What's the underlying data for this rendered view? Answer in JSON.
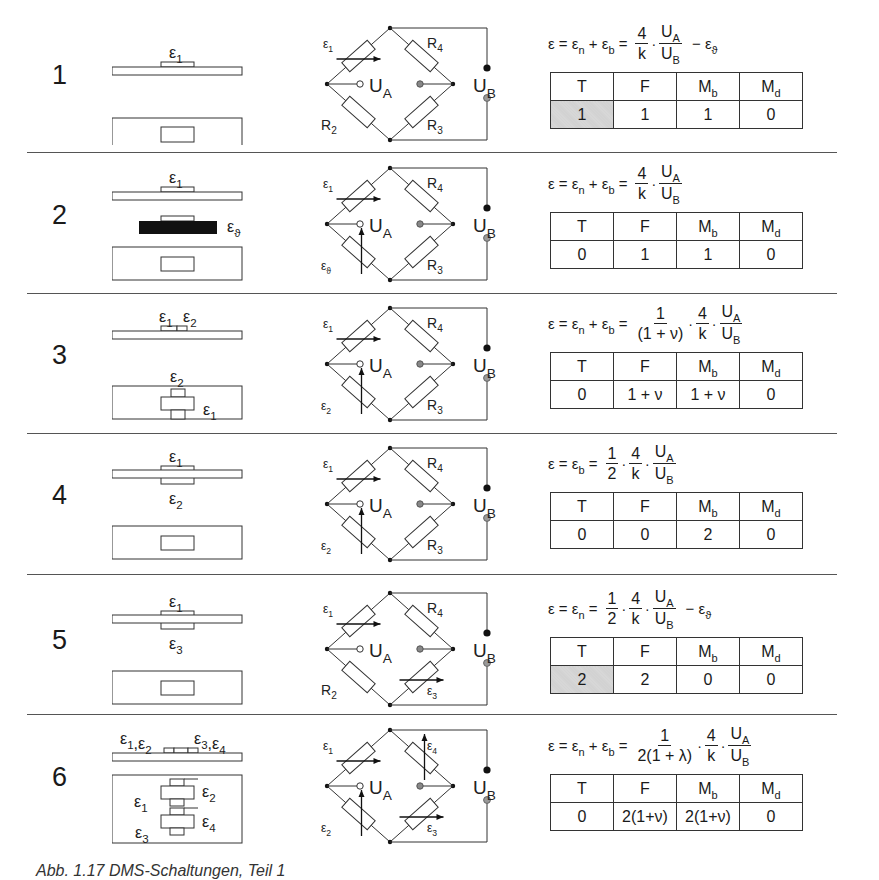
{
  "figure": {
    "caption": "Abb. 1.17 DMS-Schaltungen, Teil 1",
    "columns": [
      "T",
      "F",
      "M",
      "M"
    ],
    "column_subscripts": [
      "",
      "",
      "b",
      "d"
    ],
    "shade_color": "#d4d4d4"
  },
  "rows": [
    {
      "number": "1",
      "gauge_labels_side": [
        "ε1"
      ],
      "gauge_labels_top": [],
      "bridge": {
        "arm_tl": "ε1",
        "arm_tr": "R4",
        "arm_bl": "R2",
        "arm_br": "R3",
        "ua": "UA",
        "ub": "UB"
      },
      "equation": {
        "lhs": "ε = εn + εb =",
        "factors": [
          {
            "num": "4",
            "den": "k"
          },
          {
            "num": "UA",
            "den": "UB"
          }
        ],
        "suffix": "− εϑ"
      },
      "values": [
        "1",
        "1",
        "1",
        "0"
      ],
      "shaded_T": true
    },
    {
      "number": "2",
      "gauge_labels_side": [
        "ε1",
        "εϑ"
      ],
      "gauge_labels_top": [],
      "bridge": {
        "arm_tl": "ε1",
        "arm_tr": "R4",
        "arm_bl": "εϑ",
        "arm_br": "R3",
        "ua": "UA",
        "ub": "UB"
      },
      "equation": {
        "lhs": "ε = εn + εb =",
        "factors": [
          {
            "num": "4",
            "den": "k"
          },
          {
            "num": "UA",
            "den": "UB"
          }
        ],
        "suffix": ""
      },
      "values": [
        "0",
        "1",
        "1",
        "0"
      ],
      "shaded_T": false
    },
    {
      "number": "3",
      "gauge_labels_side": [
        "ε1 ε2"
      ],
      "gauge_labels_top": [
        "ε2",
        "ε1"
      ],
      "bridge": {
        "arm_tl": "ε1",
        "arm_tr": "R4",
        "arm_bl": "ε2",
        "arm_br": "R3",
        "ua": "UA",
        "ub": "UB"
      },
      "equation": {
        "lhs": "ε = εn + εb =",
        "factors": [
          {
            "num": "1",
            "den": "(1 + ν)"
          },
          {
            "num": "4",
            "den": "k"
          },
          {
            "num": "UA",
            "den": "UB"
          }
        ],
        "suffix": ""
      },
      "values": [
        "0",
        "1 + ν",
        "1 + ν",
        "0"
      ],
      "shaded_T": false
    },
    {
      "number": "4",
      "gauge_labels_side": [
        "ε1",
        "ε2"
      ],
      "gauge_labels_top": [],
      "bridge": {
        "arm_tl": "ε1",
        "arm_tr": "R4",
        "arm_bl": "ε2",
        "arm_br": "R3",
        "ua": "UA",
        "ub": "UB"
      },
      "equation": {
        "lhs": "ε = εb =",
        "factors": [
          {
            "num": "1",
            "den": "2"
          },
          {
            "num": "4",
            "den": "k"
          },
          {
            "num": "UA",
            "den": "UB"
          }
        ],
        "suffix": ""
      },
      "values": [
        "0",
        "0",
        "2",
        "0"
      ],
      "shaded_T": false
    },
    {
      "number": "5",
      "gauge_labels_side": [
        "ε1",
        "ε3"
      ],
      "gauge_labels_top": [],
      "bridge": {
        "arm_tl": "ε1",
        "arm_tr": "R4",
        "arm_bl": "R2",
        "arm_br": "ε3",
        "ua": "UA",
        "ub": "UB"
      },
      "equation": {
        "lhs": "ε = εn =",
        "factors": [
          {
            "num": "1",
            "den": "2"
          },
          {
            "num": "4",
            "den": "k"
          },
          {
            "num": "UA",
            "den": "UB"
          }
        ],
        "suffix": "− εϑ"
      },
      "values": [
        "2",
        "2",
        "0",
        "0"
      ],
      "shaded_T": true
    },
    {
      "number": "6",
      "gauge_labels_side": [
        "ε1,ε2",
        "ε3,ε4"
      ],
      "gauge_labels_top": [
        "ε1",
        "ε2",
        "ε3",
        "ε4"
      ],
      "bridge": {
        "arm_tl": "ε1",
        "arm_tr": "ε4",
        "arm_bl": "ε2",
        "arm_br": "ε3",
        "ua": "UA",
        "ub": "UB"
      },
      "equation": {
        "lhs": "ε = εn + εb =",
        "factors": [
          {
            "num": "1",
            "den": "2(1 + λ)"
          },
          {
            "num": "4",
            "den": "k"
          },
          {
            "num": "UA",
            "den": "UB"
          }
        ],
        "suffix": ""
      },
      "values": [
        "0",
        "2(1+ν)",
        "2(1+ν)",
        "0"
      ],
      "shaded_T": false
    }
  ]
}
